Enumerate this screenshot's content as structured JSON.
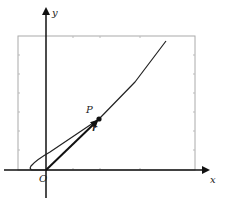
{
  "diagram": {
    "title": "",
    "labels": {
      "y_axis": "y",
      "x_axis": "x",
      "origin": "O",
      "point": "P",
      "vector": "r"
    },
    "colors": {
      "axis": "#111111",
      "curve": "#222222",
      "box": "#aaaaaa",
      "tick": "#bbbbbb",
      "background": "#ffffff"
    }
  }
}
